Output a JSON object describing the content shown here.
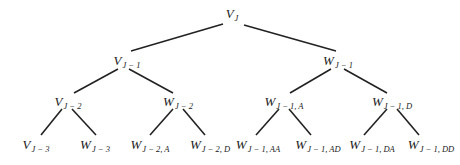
{
  "diagram": {
    "type": "binary-tree",
    "line_color": "#222222",
    "nodes": [
      {
        "id": "vj",
        "base": "V",
        "sub": "J",
        "x": 232,
        "y": 15
      },
      {
        "id": "vj1",
        "base": "V",
        "sub": "J − 1",
        "x": 127,
        "y": 62
      },
      {
        "id": "wj1",
        "base": "W",
        "sub": "J − 1",
        "x": 338,
        "y": 62
      },
      {
        "id": "vj2",
        "base": "V",
        "sub": "J − 2",
        "x": 68,
        "y": 103
      },
      {
        "id": "wj2",
        "base": "W",
        "sub": "J − 2",
        "x": 178,
        "y": 103
      },
      {
        "id": "wj1a",
        "base": "W",
        "sub": "J − 1, A",
        "x": 284,
        "y": 103
      },
      {
        "id": "wj1d",
        "base": "W",
        "sub": "J − 1, D",
        "x": 392,
        "y": 103
      },
      {
        "id": "vj3",
        "base": "V",
        "sub": "J − 3",
        "x": 36,
        "y": 146
      },
      {
        "id": "wj3",
        "base": "W",
        "sub": "J − 3",
        "x": 95,
        "y": 146
      },
      {
        "id": "wj2a",
        "base": "W",
        "sub": "J − 2, A",
        "x": 150,
        "y": 146
      },
      {
        "id": "wj2d",
        "base": "W",
        "sub": "J − 2, D",
        "x": 210,
        "y": 146
      },
      {
        "id": "wj1aa",
        "base": "W",
        "sub": "J − 1, AA",
        "x": 258,
        "y": 146
      },
      {
        "id": "wj1ad",
        "base": "W",
        "sub": "J − 1, AD",
        "x": 318,
        "y": 146
      },
      {
        "id": "wj1da",
        "base": "W",
        "sub": "J − 1, DA",
        "x": 372,
        "y": 146
      },
      {
        "id": "wj1dd",
        "base": "W",
        "sub": "J − 1, DD",
        "x": 431,
        "y": 146
      }
    ],
    "edges": [
      {
        "x1": 223,
        "y1": 24,
        "x2": 131,
        "y2": 51
      },
      {
        "x1": 244,
        "y1": 25,
        "x2": 336,
        "y2": 51
      },
      {
        "x1": 118,
        "y1": 69,
        "x2": 74,
        "y2": 93
      },
      {
        "x1": 129,
        "y1": 69,
        "x2": 173,
        "y2": 93
      },
      {
        "x1": 331,
        "y1": 69,
        "x2": 290,
        "y2": 93
      },
      {
        "x1": 344,
        "y1": 69,
        "x2": 387,
        "y2": 93
      },
      {
        "x1": 62,
        "y1": 109,
        "x2": 41,
        "y2": 135
      },
      {
        "x1": 72,
        "y1": 109,
        "x2": 96,
        "y2": 135
      },
      {
        "x1": 173,
        "y1": 109,
        "x2": 150,
        "y2": 135
      },
      {
        "x1": 183,
        "y1": 109,
        "x2": 205,
        "y2": 135
      },
      {
        "x1": 279,
        "y1": 109,
        "x2": 256,
        "y2": 135
      },
      {
        "x1": 289,
        "y1": 109,
        "x2": 311,
        "y2": 135
      },
      {
        "x1": 387,
        "y1": 109,
        "x2": 364,
        "y2": 135
      },
      {
        "x1": 397,
        "y1": 109,
        "x2": 419,
        "y2": 135
      }
    ]
  }
}
